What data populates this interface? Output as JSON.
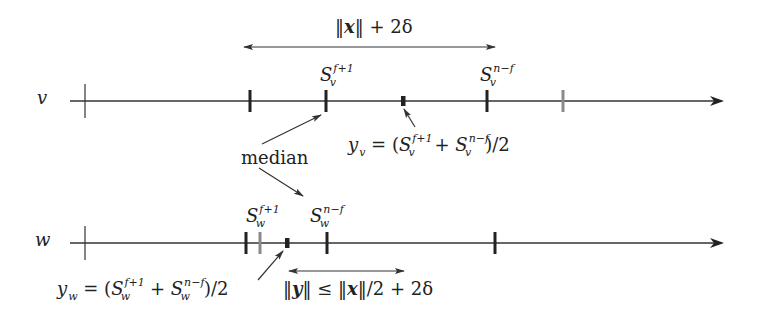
{
  "diagram": {
    "colors": {
      "line": "#333333",
      "tick_dark": "#222222",
      "tick_gray": "#8a8a8a",
      "text": "#222222"
    },
    "lines": [
      {
        "id": "v",
        "label": "v",
        "y": 101,
        "x_start": 70,
        "x_end": 725,
        "origin_x": 85,
        "ticks": [
          {
            "x": 250,
            "style": "dark",
            "label": ""
          },
          {
            "x": 326,
            "style": "dark",
            "label": "S_v^{f+1}"
          },
          {
            "x": 403,
            "style": "midpoint",
            "label": "y_v"
          },
          {
            "x": 487,
            "style": "dark",
            "label": "S_v^{n-f}"
          },
          {
            "x": 563,
            "style": "gray",
            "label": ""
          }
        ]
      },
      {
        "id": "w",
        "label": "w",
        "y": 243,
        "x_start": 70,
        "x_end": 725,
        "origin_x": 85,
        "ticks": [
          {
            "x": 246,
            "style": "dark",
            "label": ""
          },
          {
            "x": 260,
            "style": "gray",
            "label": ""
          },
          {
            "x": 287,
            "style": "midpoint",
            "label": "y_w"
          },
          {
            "x": 327,
            "style": "dark",
            "label": "S_w^{n-f}"
          },
          {
            "x": 495,
            "style": "dark",
            "label": ""
          }
        ]
      }
    ],
    "labels": {
      "v_axis": "v",
      "w_axis": "w",
      "median": "median",
      "Sv_f1": {
        "base": "S",
        "sub": "v",
        "sup": "f+1"
      },
      "Sv_nf": {
        "base": "S",
        "sub": "v",
        "sup": "n−f"
      },
      "Sw_f1": {
        "base": "S",
        "sub": "w",
        "sup": "f+1"
      },
      "Sw_nf": {
        "base": "S",
        "sub": "w",
        "sup": "n−f"
      },
      "yv_formula": {
        "lhs_base": "y",
        "lhs_sub": "v",
        "eq": " = (",
        "t1_base": "S",
        "t1_sub": "v",
        "t1_sup": "f+1",
        "plus": " + ",
        "t2_base": "S",
        "t2_sub": "v",
        "t2_sup": "n−f",
        "tail": ")/2"
      },
      "yw_formula": {
        "lhs_base": "y",
        "lhs_sub": "w",
        "eq": " = (",
        "t1_base": "S",
        "t1_sub": "w",
        "t1_sup": "f+1",
        "plus": " + ",
        "t2_base": "S",
        "t2_sub": "w",
        "t2_sup": "n−f",
        "tail": ")/2"
      },
      "top_range": {
        "norm_open": "‖",
        "var": "x",
        "norm_close": "‖",
        "rest": " + 2δ"
      },
      "bottom_range": {
        "n1_open": "‖",
        "var1": "y",
        "n1_close": "‖",
        "rel": " ≤ ",
        "n2_open": "‖",
        "var2": "x",
        "n2_close": "‖",
        "rest": "/2 + 2δ"
      }
    },
    "ranges": [
      {
        "id": "top",
        "x1": 243,
        "x2": 496,
        "y": 47,
        "label": "‖x‖ + 2δ"
      },
      {
        "id": "bottom",
        "x1": 288,
        "x2": 405,
        "y": 271,
        "label": "‖y‖ ≤ ‖x‖/2 + 2δ"
      }
    ]
  }
}
